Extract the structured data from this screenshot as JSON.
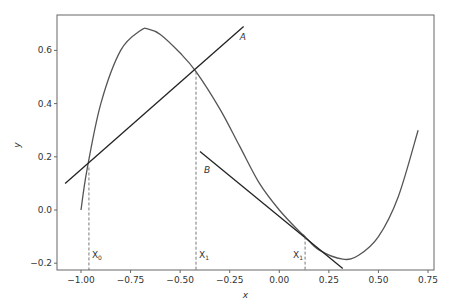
{
  "chart_data": {
    "type": "line",
    "title": "",
    "xlabel": "x",
    "ylabel": "y",
    "xlim": [
      -1.12,
      0.78
    ],
    "ylim": [
      -0.22,
      0.73
    ],
    "grid": false,
    "x_ticks": [
      -1.0,
      -0.75,
      -0.5,
      -0.25,
      0.0,
      0.25,
      0.5,
      0.75
    ],
    "x_tick_labels": [
      "−1.00",
      "−0.75",
      "−0.50",
      "−0.25",
      "0.00",
      "0.25",
      "0.50",
      "0.75"
    ],
    "y_ticks": [
      -0.2,
      0.0,
      0.2,
      0.4,
      0.6
    ],
    "y_tick_labels": [
      "−0.2",
      "0.0",
      "0.2",
      "0.4",
      "0.6"
    ],
    "series": [
      {
        "name": "curve",
        "x": [
          -1.0,
          -0.97,
          -0.9,
          -0.8,
          -0.7,
          -0.66,
          -0.6,
          -0.5,
          -0.42,
          -0.3,
          -0.2,
          -0.1,
          0.0,
          0.1,
          0.13,
          0.2,
          0.32,
          0.4,
          0.5,
          0.6,
          0.7
        ],
        "y": [
          0.0,
          0.15,
          0.4,
          0.6,
          0.675,
          0.68,
          0.66,
          0.59,
          0.52,
          0.38,
          0.24,
          0.1,
          0.0,
          -0.08,
          -0.1,
          -0.15,
          -0.185,
          -0.17,
          -0.1,
          0.05,
          0.3
        ],
        "color": "#555555"
      },
      {
        "name": "A",
        "x": [
          -1.08,
          -0.18
        ],
        "y": [
          0.1,
          0.69
        ],
        "color": "#222222"
      },
      {
        "name": "B",
        "x": [
          -0.4,
          0.32
        ],
        "y": [
          0.22,
          -0.22
        ],
        "color": "#222222"
      }
    ],
    "vertical_markers": [
      {
        "x": -0.96,
        "y_top": 0.16,
        "label": "X",
        "subscript": "0"
      },
      {
        "x": -0.42,
        "y_top": 0.52,
        "label": "X",
        "subscript": "1"
      },
      {
        "x": 0.13,
        "y_top": -0.1,
        "label": "X",
        "subscript": "1"
      }
    ],
    "annotations": [
      {
        "text": "A",
        "x": -0.2,
        "y": 0.64
      },
      {
        "text": "B",
        "x": -0.38,
        "y": 0.14
      }
    ]
  }
}
